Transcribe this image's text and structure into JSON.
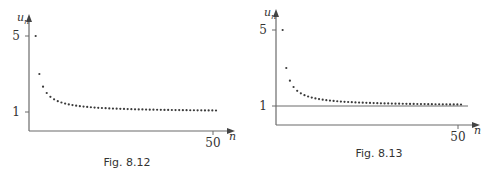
{
  "chart_data": [
    {
      "type": "scatter",
      "id": "fig-8-12",
      "caption": "Fig. 8.12",
      "xlabel": "n",
      "ylabel": "u",
      "ylabel_sub": "n",
      "x_ticks": [
        {
          "value": 50,
          "label": "50"
        }
      ],
      "y_ticks": [
        {
          "value": 5,
          "label": "5"
        },
        {
          "value": 1,
          "label": "1"
        }
      ],
      "xlim": [
        0,
        52.5
      ],
      "ylim": [
        0,
        6
      ],
      "show_limit_line": false,
      "formula": "u_n = 1 + 4/n",
      "x": [
        1,
        2,
        3,
        4,
        5,
        6,
        7,
        8,
        9,
        10,
        11,
        12,
        13,
        14,
        15,
        16,
        17,
        18,
        19,
        20,
        21,
        22,
        23,
        24,
        25,
        26,
        27,
        28,
        29,
        30,
        31,
        32,
        33,
        34,
        35,
        36,
        37,
        38,
        39,
        40,
        41,
        42,
        43,
        44,
        45,
        46,
        47,
        48,
        49,
        50
      ],
      "values": [
        5,
        3,
        2.333,
        2,
        1.8,
        1.667,
        1.571,
        1.5,
        1.444,
        1.4,
        1.364,
        1.333,
        1.308,
        1.286,
        1.267,
        1.25,
        1.235,
        1.222,
        1.211,
        1.2,
        1.19,
        1.182,
        1.174,
        1.167,
        1.16,
        1.154,
        1.148,
        1.143,
        1.138,
        1.133,
        1.129,
        1.125,
        1.121,
        1.118,
        1.114,
        1.111,
        1.108,
        1.105,
        1.103,
        1.1,
        1.098,
        1.095,
        1.093,
        1.091,
        1.089,
        1.087,
        1.085,
        1.083,
        1.082,
        1.08
      ]
    },
    {
      "type": "scatter",
      "id": "fig-8-13",
      "caption": "Fig. 8.13",
      "xlabel": "n",
      "ylabel": "u",
      "ylabel_sub": "n",
      "x_ticks": [
        {
          "value": 50,
          "label": "50"
        }
      ],
      "y_ticks": [
        {
          "value": 5,
          "label": "5"
        },
        {
          "value": 1,
          "label": "1"
        }
      ],
      "xlim": [
        0,
        52.5
      ],
      "ylim": [
        0,
        6
      ],
      "show_limit_line": true,
      "limit_value": 1,
      "formula": "u_n = 1 + 4/n",
      "x": [
        1,
        2,
        3,
        4,
        5,
        6,
        7,
        8,
        9,
        10,
        11,
        12,
        13,
        14,
        15,
        16,
        17,
        18,
        19,
        20,
        21,
        22,
        23,
        24,
        25,
        26,
        27,
        28,
        29,
        30,
        31,
        32,
        33,
        34,
        35,
        36,
        37,
        38,
        39,
        40,
        41,
        42,
        43,
        44,
        45,
        46,
        47,
        48,
        49,
        50
      ],
      "values": [
        5,
        3,
        2.333,
        2,
        1.8,
        1.667,
        1.571,
        1.5,
        1.444,
        1.4,
        1.364,
        1.333,
        1.308,
        1.286,
        1.267,
        1.25,
        1.235,
        1.222,
        1.211,
        1.2,
        1.19,
        1.182,
        1.174,
        1.167,
        1.16,
        1.154,
        1.148,
        1.143,
        1.138,
        1.133,
        1.129,
        1.125,
        1.121,
        1.118,
        1.114,
        1.111,
        1.108,
        1.105,
        1.103,
        1.1,
        1.098,
        1.095,
        1.093,
        1.091,
        1.089,
        1.087,
        1.085,
        1.083,
        1.082,
        1.08
      ]
    }
  ]
}
